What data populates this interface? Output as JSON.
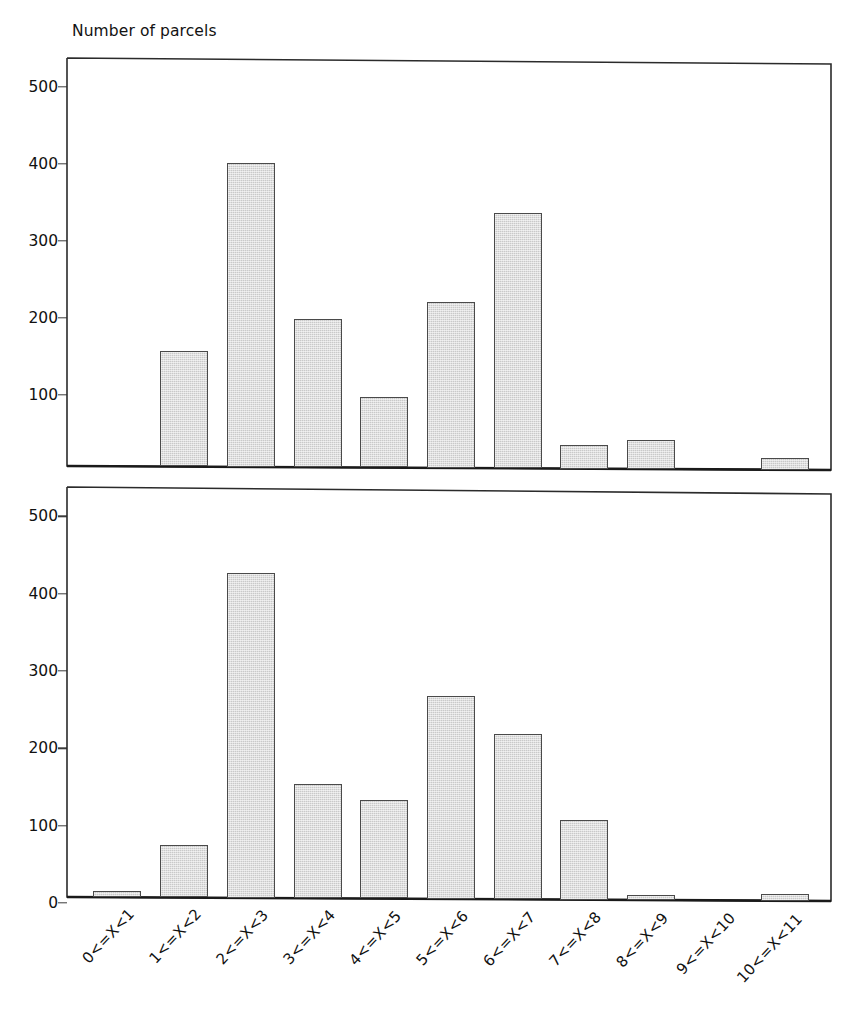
{
  "figure": {
    "axis_title": "Number of parcels",
    "bar_fill_color": "#c9c9c9",
    "bar_edge_color": "#4a4a4a",
    "background_color": "#ffffff"
  },
  "categories": [
    "0<=X<1",
    "1<=X<2",
    "2<=X<3",
    "3<=X<4",
    "4<=X<5",
    "5<=X<6",
    "6<=X<7",
    "7<=X<8",
    "8<=X<9",
    "9<=X<10",
    "10<=X<11"
  ],
  "panels": [
    {
      "name": "top-histogram",
      "yticks": [
        "100",
        "200",
        "300",
        "400",
        "500"
      ],
      "ytick_values": [
        100,
        200,
        300,
        400,
        500
      ],
      "ylim": [
        0,
        530
      ],
      "values": [
        0,
        150,
        395,
        192,
        92,
        216,
        331,
        30,
        38,
        0,
        15
      ]
    },
    {
      "name": "bottom-histogram",
      "yticks": [
        "0",
        "100",
        "200",
        "300",
        "400",
        "500"
      ],
      "ytick_values": [
        0,
        100,
        200,
        300,
        400,
        500
      ],
      "ylim": [
        0,
        530
      ],
      "values": [
        8,
        68,
        420,
        147,
        127,
        262,
        214,
        103,
        4,
        0,
        8
      ]
    }
  ],
  "chart_data": [
    {
      "type": "bar",
      "title": "Number of parcels",
      "subtitle": "",
      "xlabel": "",
      "ylabel": "Number of parcels",
      "categories": [
        "0<=X<1",
        "1<=X<2",
        "2<=X<3",
        "3<=X<4",
        "4<=X<5",
        "5<=X<6",
        "6<=X<7",
        "7<=X<8",
        "8<=X<9",
        "9<=X<10",
        "10<=X<11"
      ],
      "values": [
        0,
        150,
        395,
        192,
        92,
        216,
        331,
        30,
        38,
        0,
        15
      ],
      "ylim": [
        0,
        530
      ],
      "yticks": [
        100,
        200,
        300,
        400,
        500
      ],
      "grid": false,
      "legend": false,
      "legend_position": "none",
      "notes": "Upper panel. No x tick labels drawn on this panel; categories shared with lower panel. Categories 0<=X<1 and 9<=X<10 have no visible bar."
    },
    {
      "type": "bar",
      "title": "",
      "subtitle": "",
      "xlabel": "",
      "ylabel": "Number of parcels",
      "categories": [
        "0<=X<1",
        "1<=X<2",
        "2<=X<3",
        "3<=X<4",
        "4<=X<5",
        "5<=X<6",
        "6<=X<7",
        "7<=X<8",
        "8<=X<9",
        "9<=X<10",
        "10<=X<11"
      ],
      "values": [
        8,
        68,
        420,
        147,
        127,
        262,
        214,
        103,
        4,
        0,
        8
      ],
      "ylim": [
        0,
        530
      ],
      "yticks": [
        0,
        100,
        200,
        300,
        400,
        500
      ],
      "grid": false,
      "legend": false,
      "legend_position": "none",
      "notes": "Lower panel. X tick labels rotated about 45 degrees. Category 9<=X<10 has no bar."
    }
  ]
}
